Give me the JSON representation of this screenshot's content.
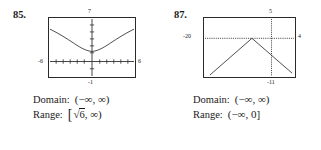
{
  "problems": [
    {
      "number": "85.",
      "graph": {
        "type": "line",
        "curve": "upward-parabola",
        "axis_top_label": "7",
        "axis_bottom_label": "-1",
        "axis_left_label": "-6",
        "axis_right_label": "6",
        "xlim": [
          -6,
          6
        ],
        "ylim": [
          -1,
          7
        ],
        "x_axis_visible": true,
        "y_axis_visible": true,
        "axis_style": "tick-marked",
        "vertex": [
          0,
          2.45
        ]
      },
      "answers": {
        "domain_label": "Domain:",
        "domain_value": "(−∞, ∞)",
        "range_label": "Range:",
        "range_open_bracket": "[",
        "range_radical": "√",
        "range_radicand": "6",
        "range_tail": ", ∞)"
      }
    },
    {
      "number": "87.",
      "graph": {
        "type": "line",
        "curve": "inverted-absolute-value",
        "axis_top_label": "5",
        "axis_bottom_label": "-11",
        "axis_left_label": "-20",
        "axis_right_label": "4",
        "xlim": [
          -20,
          4
        ],
        "ylim": [
          -11,
          5
        ],
        "x_axis_visible": true,
        "y_axis_visible": true,
        "axis_style": "dotted",
        "vertex": [
          -9,
          0
        ]
      },
      "answers": {
        "domain_label": "Domain:",
        "domain_value": "(−∞, ∞)",
        "range_label": "Range:",
        "range_value": "(−∞, 0]"
      }
    }
  ],
  "colors": {
    "ink": "#1a1a1a",
    "frame": "#2b2b2b",
    "background": "#ffffff"
  }
}
